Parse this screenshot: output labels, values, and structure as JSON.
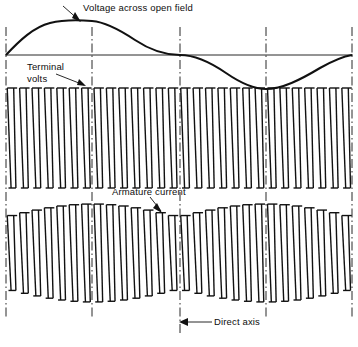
{
  "figure": {
    "kind": "oscillogram",
    "background_color": "#ffffff",
    "ink_color": "#111111",
    "width": 358,
    "height": 347
  },
  "labels": {
    "voltage_across_open_field": "Voltage across open field",
    "terminal_volts": "Terminal\nvolts",
    "terminal_volts_line1": "Terminal",
    "terminal_volts_line2": "volts",
    "armature_current": "Armature current",
    "direct_axis": "Direct axis"
  },
  "chart_data": {
    "type": "line",
    "title": "Voltage across open field",
    "xlabel": "",
    "ylabel": "",
    "grid": false,
    "legend": "none",
    "axis_ranges": {
      "x": [
        0,
        358
      ],
      "y_top_trace": [
        20,
        90
      ],
      "y_terminal_volts": [
        88,
        188
      ],
      "y_armature_current": [
        205,
        302
      ]
    },
    "reference_lines": {
      "name": "direct-axis-markers",
      "style": "dash-dot vertical",
      "x_positions": [
        6,
        92,
        180,
        266,
        352
      ],
      "labelled": "Direct axis"
    },
    "horizontal_axis_line": {
      "y": 55,
      "x_from": 6,
      "x_to": 352
    },
    "series": [
      {
        "name": "Voltage across open field",
        "trace": "sine",
        "cycles": 1,
        "amplitude": 34,
        "baseline_y": 55,
        "phase": "starts at zero rising",
        "peak": {
          "x": 92,
          "y": 21
        },
        "zero_crossing": {
          "x": 180,
          "y": 55
        },
        "trough": {
          "x": 266,
          "y": 89
        },
        "end": {
          "x": 352,
          "y": 55
        }
      },
      {
        "name": "Terminal volts",
        "trace": "rectified-pulse-train",
        "pulse_count": 28,
        "envelope": "flat",
        "top_y": 88,
        "bottom_y": 188,
        "pulse_shape": "narrow spike with flared top and bottom serif"
      },
      {
        "name": "Armature current",
        "trace": "amplitude-modulated-pulse-train",
        "pulse_count": 28,
        "envelope": "modulated, widest at direct-axis lines x=92 and x=266, narrowest at x=6, 180, 352",
        "center_y": 253,
        "max_half_amplitude": 49,
        "min_half_amplitude": 36,
        "pulse_shape": "narrow spike with flared top and bottom serif"
      }
    ],
    "annotations": [
      {
        "text": "Voltage across open field",
        "leader_from": [
          90,
          18
        ],
        "leader_to": [
          62,
          5
        ]
      },
      {
        "text": "Terminal volts",
        "leader_from": [
          88,
          82
        ],
        "leader_to": [
          55,
          72
        ]
      },
      {
        "text": "Armature current",
        "leader_from": [
          160,
          208
        ],
        "leader_to": [
          150,
          196
        ]
      },
      {
        "text": "Direct axis",
        "leader_from": [
          180,
          322
        ],
        "leader_to": [
          212,
          322
        ]
      }
    ]
  }
}
